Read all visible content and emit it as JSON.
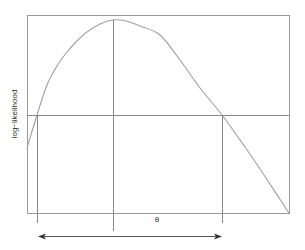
{
  "chart_data": {
    "type": "line",
    "title": "",
    "xlabel": "θ",
    "ylabel": "log−likelihood",
    "grid": false,
    "legend": null,
    "curve_points_px": [
      [
        27,
        148
      ],
      [
        37,
        115
      ],
      [
        47,
        85
      ],
      [
        57,
        66
      ],
      [
        67,
        52
      ],
      [
        77,
        41
      ],
      [
        87,
        32
      ],
      [
        100,
        24
      ],
      [
        113,
        20
      ],
      [
        126,
        21
      ],
      [
        140,
        26
      ],
      [
        160,
        35
      ],
      [
        180,
        60
      ],
      [
        200,
        88
      ],
      [
        222,
        115
      ],
      [
        245,
        147
      ],
      [
        268,
        181
      ],
      [
        289,
        213
      ]
    ],
    "maximum": {
      "x_px": 113,
      "y_px": 20
    },
    "cutoff_line_y_px": 115,
    "interval": {
      "left_x_px": 37,
      "right_x_px": 222
    },
    "plot_box_px": {
      "left": 27,
      "top": 15,
      "right": 289,
      "bottom": 213
    }
  },
  "labels": {
    "y_axis": "log−likelihood",
    "x_axis": "θ"
  }
}
